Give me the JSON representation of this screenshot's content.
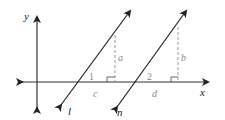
{
  "diagram": {
    "axes": {
      "x_label": "x",
      "y_label": "y"
    },
    "lines": [
      {
        "name": "l",
        "label": "l"
      },
      {
        "name": "n",
        "label": "n"
      }
    ],
    "segments": {
      "a": "a",
      "b": "b",
      "c": "c",
      "d": "d"
    },
    "angles": {
      "angle1": "1",
      "angle2": "2"
    },
    "colors": {
      "axis": "#222222",
      "line": "#222222",
      "dashed": "#9a9a9a",
      "label_gray": "#8a8a8a"
    }
  }
}
